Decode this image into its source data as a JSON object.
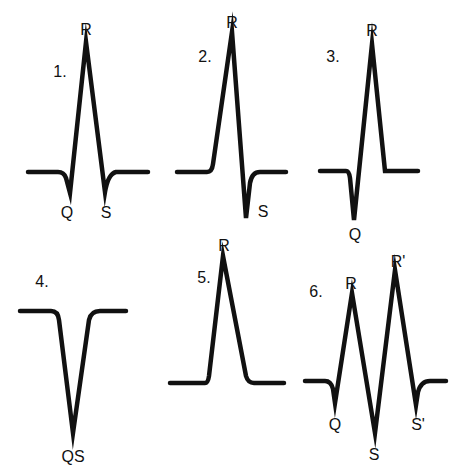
{
  "figure": {
    "panels": [
      {
        "number": "1.",
        "labels": {
          "peak": "R",
          "first_dip": "Q",
          "second_dip": "S"
        }
      },
      {
        "number": "2.",
        "labels": {
          "peak": "R",
          "dip": "S"
        }
      },
      {
        "number": "3.",
        "labels": {
          "peak": "R",
          "dip": "Q"
        }
      },
      {
        "number": "4.",
        "labels": {
          "dip": "QS"
        }
      },
      {
        "number": "5.",
        "labels": {
          "peak": "R"
        }
      },
      {
        "number": "6.",
        "labels": {
          "peak1": "R",
          "peak2": "R'",
          "dip1": "Q",
          "dip2": "S",
          "dip3": "S'"
        }
      }
    ]
  },
  "colors": {
    "stroke": "#111111",
    "background": "#ffffff"
  }
}
